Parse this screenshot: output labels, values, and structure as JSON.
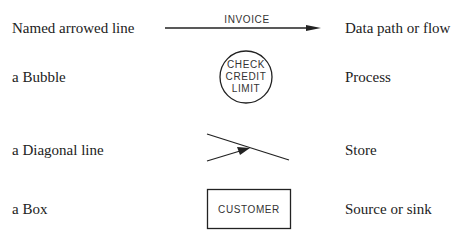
{
  "rows": [
    {
      "name": "Named arrowed line",
      "symbol_label": "INVOICE",
      "meaning": "Data path or flow"
    },
    {
      "name": "a Bubble",
      "symbol_label_lines": [
        "CHECK",
        "CREDIT",
        "LIMIT"
      ],
      "meaning": "Process"
    },
    {
      "name": "a Diagonal line",
      "meaning": "Store"
    },
    {
      "name": "a Box",
      "symbol_label": "CUSTOMER",
      "meaning": "Source or sink"
    }
  ],
  "colors": {
    "ink": "#222222",
    "background": "#ffffff"
  }
}
